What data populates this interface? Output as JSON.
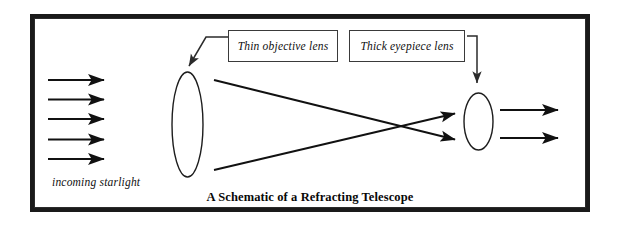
{
  "figure": {
    "title": "A Schematic of a Refracting Telescope",
    "incoming_label": "incoming starlight",
    "frame_color": "#1a1a1a",
    "ink_color": "#111111",
    "background": "#ffffff"
  },
  "labels": {
    "objective": "Thin objective lens",
    "eyepiece": "Thick eyepiece lens"
  },
  "components": {
    "objective_lens": {
      "name": "thin objective lens",
      "shape": "ellipse",
      "cx": 187.5,
      "cy": 124.5,
      "rx": 15.5,
      "ry": 52.5
    },
    "eyepiece_lens": {
      "name": "thick eyepiece lens",
      "shape": "ellipse",
      "cx": 478.5,
      "cy": 121.5,
      "rx": 14.5,
      "ry": 28.5
    }
  },
  "rays": {
    "incoming_count": 5,
    "incoming_y": [
      80,
      99.5,
      119,
      139.5,
      159
    ],
    "incoming_x_start": 48,
    "incoming_x_end": 112,
    "outgoing_count": 2,
    "outgoing_y": [
      110,
      138
    ],
    "outgoing_x_start": 500,
    "outgoing_x_end": 566,
    "crossing_rays": [
      {
        "x1": 214,
        "y1": 80,
        "x2": 461,
        "y2": 141
      },
      {
        "x1": 214,
        "y1": 170,
        "x2": 461,
        "y2": 112
      }
    ]
  }
}
